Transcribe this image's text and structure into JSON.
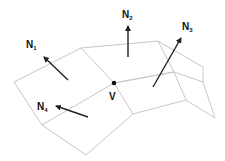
{
  "diagram": {
    "vertex": {
      "label": "V",
      "x": 114,
      "y": 83
    },
    "normals": [
      {
        "id": "N1",
        "label": "N",
        "sub": "1",
        "from": [
          68,
          80
        ],
        "to": [
          44,
          57
        ],
        "label_pos": [
          26,
          40
        ]
      },
      {
        "id": "N2",
        "label": "N",
        "sub": "2",
        "from": [
          128,
          57
        ],
        "to": [
          128,
          26
        ],
        "label_pos": [
          122,
          10
        ]
      },
      {
        "id": "N3",
        "label": "N",
        "sub": "3",
        "from": [
          153,
          87
        ],
        "to": [
          181,
          38
        ],
        "label_pos": [
          182,
          22
        ]
      },
      {
        "id": "N4",
        "label": "N",
        "sub": "4",
        "from": [
          88,
          117
        ],
        "to": [
          56,
          106
        ],
        "label_pos": [
          37,
          102
        ]
      }
    ],
    "colors": {
      "mesh": "#c8c8c8",
      "arrow": "#222222",
      "text": "#111111"
    }
  }
}
